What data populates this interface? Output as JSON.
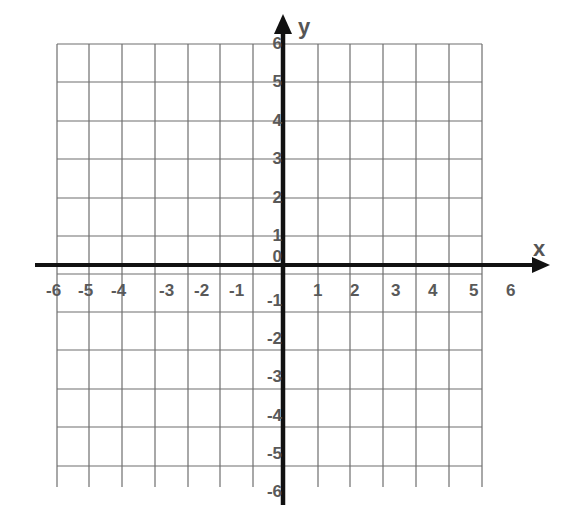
{
  "chart_data": {
    "type": "scatter",
    "title": "",
    "xlabel": "x",
    "ylabel": "y",
    "xlim": [
      -6,
      6
    ],
    "ylim": [
      -6,
      6
    ],
    "grid": true,
    "legend": null,
    "x_ticks": [
      "-6",
      "-5",
      "-4",
      "-3",
      "-2",
      "-1",
      "1",
      "2",
      "3",
      "4",
      "5",
      "6"
    ],
    "y_ticks": [
      "6",
      "5",
      "4",
      "3",
      "2",
      "1",
      "0",
      "-1",
      "-2",
      "-3",
      "-4",
      "-5",
      "-6"
    ],
    "series": []
  },
  "axes": {
    "x_name": "x",
    "y_name": "y",
    "axis_color": "#111111",
    "grid_color": "#6e6e6e",
    "label_color": "#595959"
  },
  "layout": {
    "grid_x": [
      57,
      89,
      122,
      155,
      188,
      220,
      253,
      318,
      350,
      383,
      416,
      449,
      482
    ],
    "grid_y": [
      44,
      82,
      121,
      159,
      198,
      236,
      274,
      312,
      350,
      389,
      427,
      466
    ],
    "grid_left": 57,
    "grid_right": 482,
    "grid_top": 44,
    "grid_bottom": 487,
    "x_axis_y": 265,
    "x_axis_start": 35,
    "x_axis_end": 550,
    "y_axis_x": 283,
    "y_axis_start": 505,
    "y_axis_end": 14,
    "x_tick_pos": {
      "-6": 57,
      "-5": 89,
      "-4": 122,
      "-3": 170,
      "-2": 205,
      "-1": 240,
      "1": 318,
      "2": 355,
      "3": 396,
      "4": 433,
      "5": 474,
      "6": 511
    },
    "y_tick_pos": {
      "6": 44,
      "5": 82,
      "4": 121,
      "3": 159,
      "2": 198,
      "1": 236,
      "0": 257,
      "-1": 301,
      "-2": 339,
      "-3": 377,
      "-4": 416,
      "-5": 454,
      "-6": 492
    }
  }
}
